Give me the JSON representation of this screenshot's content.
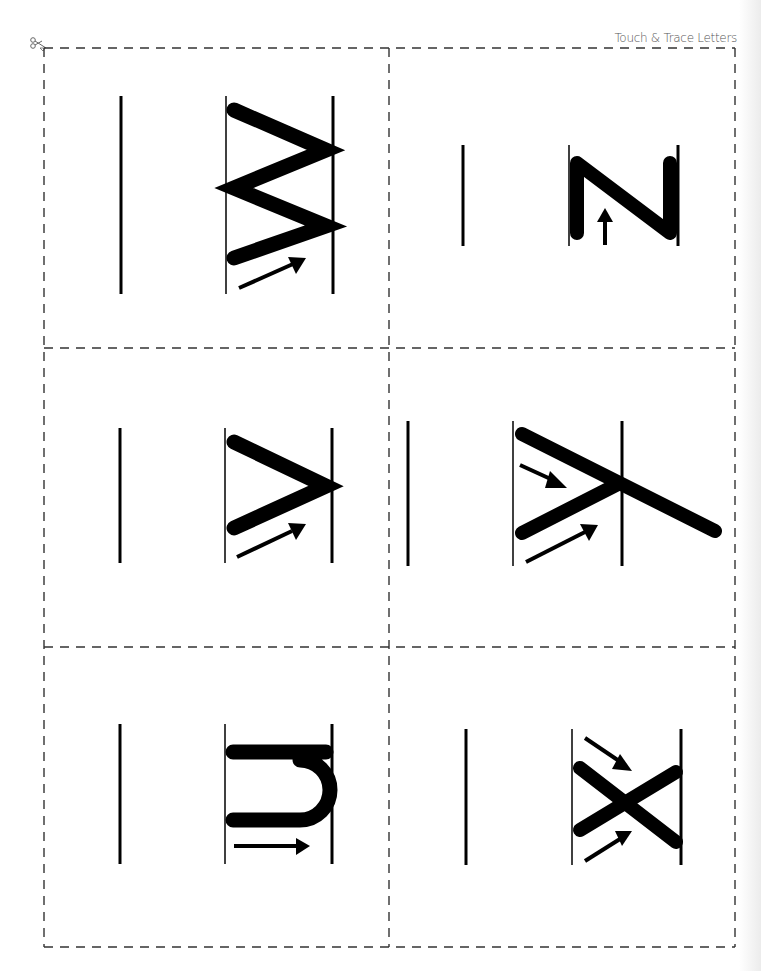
{
  "header": {
    "title": "Touch & Trace Letters",
    "cut_icon": "scissors-icon"
  },
  "cards": [
    {
      "row": 1,
      "col": 1,
      "shape": "zigzag-w",
      "arrow": "up-right",
      "label": "zigzag stroke card"
    },
    {
      "row": 1,
      "col": 2,
      "shape": "z-rotated",
      "arrow": "up",
      "label": "rotated N stroke card"
    },
    {
      "row": 2,
      "col": 1,
      "shape": "greater-than",
      "arrow": "up-right",
      "label": "greater-than stroke card"
    },
    {
      "row": 2,
      "col": 2,
      "shape": "rotated-y",
      "arrows": [
        "down-right",
        "up-right"
      ],
      "label": "rotated Y stroke card"
    },
    {
      "row": 3,
      "col": 1,
      "shape": "rotated-u",
      "arrow": "right",
      "label": "rotated U stroke card"
    },
    {
      "row": 3,
      "col": 2,
      "shape": "x-cross",
      "arrows": [
        "down-right",
        "up-right"
      ],
      "label": "X stroke card"
    }
  ],
  "colors": {
    "ink": "#000000",
    "cut_line": "#333333",
    "header_text": "#555555"
  }
}
